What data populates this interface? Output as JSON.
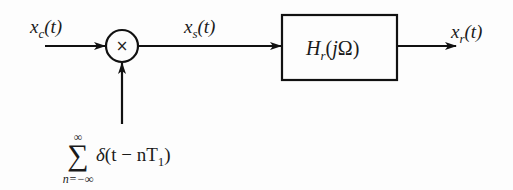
{
  "diagram": {
    "type": "block-diagram",
    "colors": {
      "stroke": "#111111",
      "text": "#1a1a1a",
      "background": "#fdfdfd"
    },
    "input": {
      "symbol": "x",
      "sub": "c",
      "arg": "(t)"
    },
    "multiplier": {
      "glyph": "×"
    },
    "sampled": {
      "symbol": "x",
      "sub": "s",
      "arg": "(t)"
    },
    "filter": {
      "symbol": "H",
      "sub": "r",
      "arg_open": "(",
      "arg_j": "j",
      "arg_omega": "Ω",
      "arg_close": ")"
    },
    "output": {
      "symbol": "x",
      "sub": "r",
      "arg": "(t)"
    },
    "impulse_train": {
      "sum_glyph": "∑",
      "upper": "∞",
      "lower": "n=−∞",
      "delta": "δ",
      "body": "(t − nT",
      "sub": "1",
      "close": ")"
    }
  }
}
